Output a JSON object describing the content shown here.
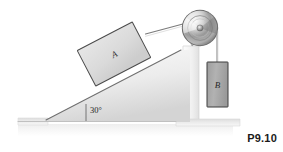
{
  "figure": {
    "id_label": "P9.10",
    "caption_alt": "Inclined plane with block A connected over a pulley to hanging block B",
    "angle_label": "30°",
    "block_a_label": "A",
    "block_b_label": "B"
  },
  "colors": {
    "background": "#ffffff",
    "incline_fill_light": "#f2f2f2",
    "incline_fill_dark": "#d9d9d9",
    "ground_fill": "#e3e3e3",
    "block_a_fill": "#dcdcdc",
    "block_a_stroke": "#4a4a4a",
    "block_b_fill": "#a8a8a8",
    "block_b_stroke": "#3d3d3d",
    "pulley_light": "#f5f5f5",
    "pulley_mid": "#9a9a9a",
    "pulley_dark": "#5e5e5e",
    "rope": "#6e6e6e",
    "wall_fill": "#ededed",
    "wall_stroke": "#cfcfcf",
    "label_text": "#1a1a1a",
    "shadow": "#f4f4f4"
  },
  "geometry": {
    "incline_angle_deg": 30,
    "ground_baseline_y": 122,
    "incline_apex_x": 180,
    "incline_apex_y": 52,
    "incline_foot_x": 45,
    "pulley_center_x": 200,
    "pulley_center_y": 28,
    "pulley_radius": 18,
    "block_a_center_x": 114,
    "block_a_center_y": 54,
    "block_a_width": 62,
    "block_a_height": 40,
    "block_b_x": 207,
    "block_b_y": 62,
    "block_b_width": 20,
    "block_b_height": 44
  },
  "elements": {
    "incline_name": "inclined-plane-surface",
    "ground_name": "ground-baseline",
    "pulley_name": "pulley-wheel",
    "rope_incline_name": "rope-segment-incline",
    "rope_vertical_name": "rope-segment-vertical",
    "wall_name": "support-wall"
  }
}
